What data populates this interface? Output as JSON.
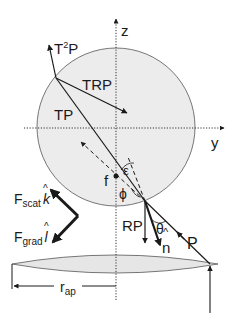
{
  "diagram": {
    "axes": {
      "z_label": "z",
      "y_label": "y"
    },
    "rays": {
      "incident": "P",
      "reflected": "RP",
      "transmitted": "TP",
      "transmitted_reflected": "TRP",
      "twice_transmitted_base": "T",
      "twice_transmitted_sup": "2",
      "twice_transmitted_tail": "P"
    },
    "angles": {
      "theta": "θ",
      "phi": "ϕ",
      "epsilon": "ε"
    },
    "normal": {
      "label": "n",
      "hat": "^"
    },
    "focus": {
      "label": "f"
    },
    "forces": {
      "scattering": {
        "base": "F",
        "sub": "scat",
        "vec": "k",
        "hat": "^"
      },
      "gradient": {
        "base": "F",
        "sub": "grad",
        "vec": "l",
        "hat": "^"
      }
    },
    "aperture": {
      "base": "r",
      "sub": "ap"
    },
    "colors": {
      "sphere_fill": "#ececec",
      "stroke": "#1a1a1a",
      "lens_fill": "#e6e6e6"
    }
  }
}
